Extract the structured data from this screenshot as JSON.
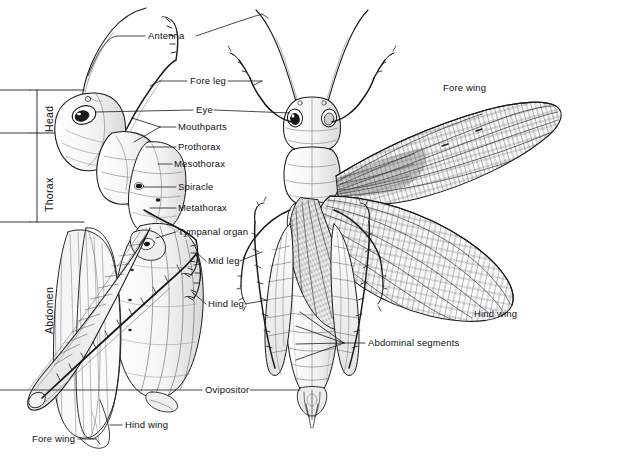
{
  "figure": {
    "background_color": "#ffffff",
    "ink_color": "#1a1a1a",
    "width": 630,
    "height": 471,
    "views": [
      {
        "name": "lateral-view",
        "description": "side view of grasshopper with wings folded"
      },
      {
        "name": "dorsal-view",
        "description": "top view of grasshopper with wings spread"
      }
    ]
  },
  "body_regions": [
    {
      "label": "Head",
      "x": 44,
      "y": 132,
      "tick_top": 90,
      "tick_bottom": 133
    },
    {
      "label": "Thorax",
      "x": 44,
      "y": 212,
      "tick_top": 133,
      "tick_bottom": 222
    },
    {
      "label": "Abdomen",
      "x": 44,
      "y": 328,
      "tick_top": 222,
      "tick_bottom": 222
    }
  ],
  "callouts": [
    {
      "name": "antenna",
      "label": "Antenna",
      "x": 148,
      "y": 36,
      "align": "left"
    },
    {
      "name": "fore-leg",
      "label": "Fore leg",
      "x": 190,
      "y": 84,
      "align": "left"
    },
    {
      "name": "eye",
      "label": "Eye",
      "x": 196,
      "y": 113,
      "align": "left"
    },
    {
      "name": "mouthparts",
      "label": "Mouthparts",
      "x": 178,
      "y": 130,
      "align": "left"
    },
    {
      "name": "prothorax",
      "label": "Prothorax",
      "x": 178,
      "y": 150,
      "align": "left"
    },
    {
      "name": "mesothorax",
      "label": "Mesothorax",
      "x": 174,
      "y": 167,
      "align": "left"
    },
    {
      "name": "spiracle",
      "label": "Spiracle",
      "x": 178,
      "y": 190,
      "align": "left"
    },
    {
      "name": "metathorax",
      "label": "Metathorax",
      "x": 178,
      "y": 211,
      "align": "left"
    },
    {
      "name": "tympanal-organ",
      "label": "Tympanal organ",
      "x": 178,
      "y": 235,
      "align": "left"
    },
    {
      "name": "mid-leg",
      "label": "Mid leg",
      "x": 208,
      "y": 264,
      "align": "left"
    },
    {
      "name": "hind-leg",
      "label": "Hind leg",
      "x": 208,
      "y": 307,
      "align": "left"
    },
    {
      "name": "ovipositor",
      "label": "Ovipositor",
      "x": 205,
      "y": 393,
      "align": "left"
    },
    {
      "name": "hind-wing-lateral",
      "label": "Hind wing",
      "x": 125,
      "y": 428,
      "align": "left"
    },
    {
      "name": "fore-wing-lateral",
      "label": "Fore wing",
      "x": 32,
      "y": 442,
      "align": "left"
    },
    {
      "name": "fore-wing-dorsal",
      "label": "Fore wing",
      "x": 443,
      "y": 88,
      "align": "left"
    },
    {
      "name": "hind-wing-dorsal",
      "label": "Hind wing",
      "x": 474,
      "y": 316,
      "align": "left"
    },
    {
      "name": "abdominal-segments",
      "label": "Abdominal segments",
      "x": 368,
      "y": 346,
      "align": "left"
    }
  ]
}
